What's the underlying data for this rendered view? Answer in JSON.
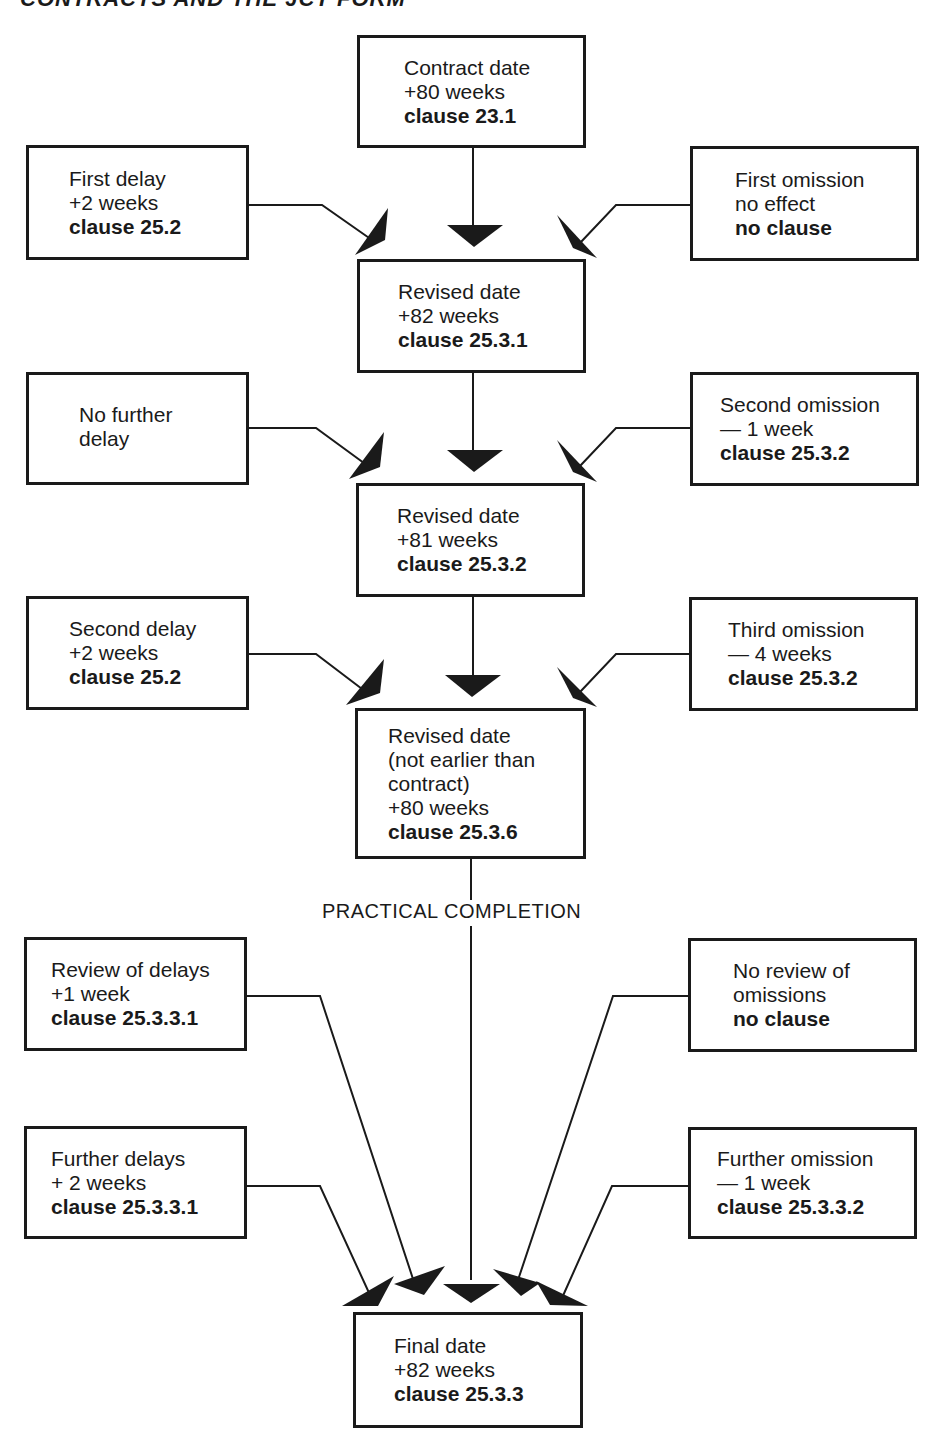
{
  "header": {
    "text": "CONTRACTS AND THE JCT FORM"
  },
  "center_column": [
    {
      "id": "contract-date",
      "lines": [
        "Contract date",
        "+80 weeks"
      ],
      "clause": "clause 23.1"
    },
    {
      "id": "revised-date-1",
      "lines": [
        "Revised date",
        "+82 weeks"
      ],
      "clause": "clause 25.3.1"
    },
    {
      "id": "revised-date-2",
      "lines": [
        "Revised date",
        "+81 weeks"
      ],
      "clause": "clause 25.3.2"
    },
    {
      "id": "revised-date-3",
      "lines": [
        "Revised date",
        "(not earlier than",
        "contract)",
        "+80 weeks"
      ],
      "clause": "clause 25.3.6"
    },
    {
      "id": "final-date",
      "lines": [
        "Final date",
        "+82 weeks"
      ],
      "clause": "clause 25.3.3"
    }
  ],
  "left_column": [
    {
      "id": "first-delay",
      "lines": [
        "First delay",
        "+2 weeks"
      ],
      "clause": "clause 25.2"
    },
    {
      "id": "no-further-delay",
      "lines": [
        "No further",
        "delay"
      ],
      "clause": ""
    },
    {
      "id": "second-delay",
      "lines": [
        "Second delay",
        "+2 weeks"
      ],
      "clause": "clause 25.2"
    },
    {
      "id": "review-of-delays",
      "lines": [
        "Review of delays",
        "+1 week"
      ],
      "clause": "clause 25.3.3.1"
    },
    {
      "id": "further-delays",
      "lines": [
        "Further delays",
        "+ 2 weeks"
      ],
      "clause": "clause 25.3.3.1"
    }
  ],
  "right_column": [
    {
      "id": "first-omission",
      "lines": [
        "First omission",
        "no effect"
      ],
      "clause": "no clause"
    },
    {
      "id": "second-omission",
      "lines": [
        "Second omission",
        "— 1 week"
      ],
      "clause": "clause 25.3.2"
    },
    {
      "id": "third-omission",
      "lines": [
        "Third omission",
        "— 4 weeks"
      ],
      "clause": "clause 25.3.2"
    },
    {
      "id": "no-review-of-omissions",
      "lines": [
        "No review of",
        "omissions"
      ],
      "clause": "no clause"
    },
    {
      "id": "further-omission",
      "lines": [
        "Further omission",
        "— 1 week"
      ],
      "clause": "clause 25.3.3.2"
    }
  ],
  "milestone": {
    "label": "PRACTICAL COMPLETION"
  },
  "colors": {
    "ink": "#1a1a1a",
    "paper": "#ffffff"
  }
}
